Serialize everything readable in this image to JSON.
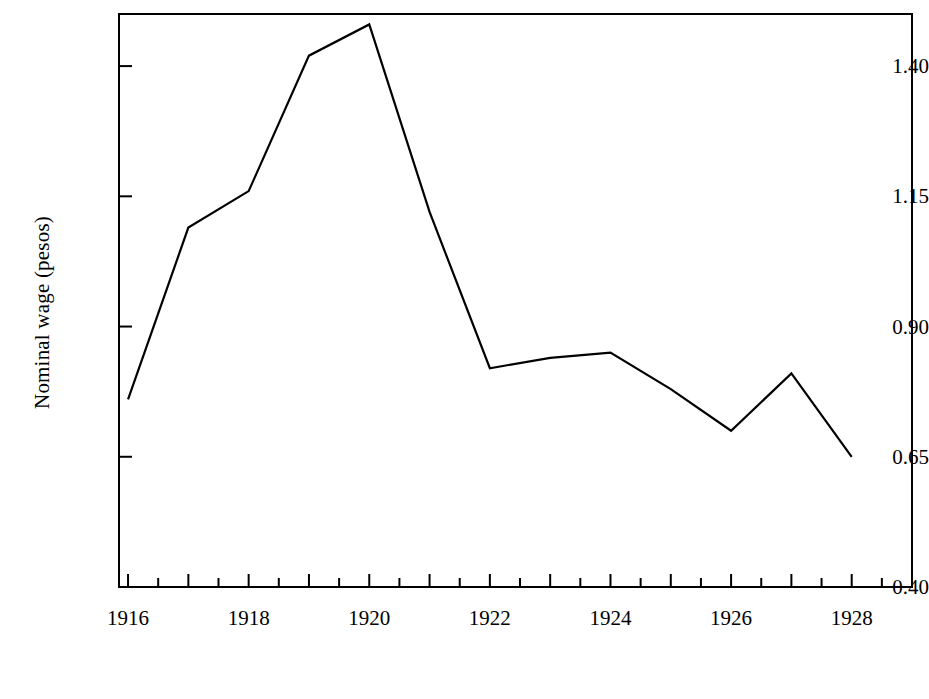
{
  "chart_data": {
    "type": "line",
    "title": "",
    "xlabel": "",
    "ylabel": "Nominal wage (pesos)",
    "x": [
      1916,
      1917,
      1918,
      1919,
      1920,
      1921,
      1922,
      1923,
      1924,
      1925,
      1926,
      1927,
      1928
    ],
    "values": [
      0.76,
      1.09,
      1.16,
      1.42,
      1.48,
      1.12,
      0.82,
      0.84,
      0.85,
      0.78,
      0.7,
      0.81,
      0.65
    ],
    "series": [
      {
        "name": "Nominal wage",
        "values": [
          0.76,
          1.09,
          1.16,
          1.42,
          1.48,
          1.12,
          0.82,
          0.84,
          0.85,
          0.78,
          0.7,
          0.81,
          0.65
        ]
      }
    ],
    "xlim": [
      1915.85,
      1929.0
    ],
    "ylim": [
      0.4,
      1.5
    ],
    "y_ticks": [
      0.4,
      0.65,
      0.9,
      1.15,
      1.4
    ],
    "y_tick_labels": [
      "0.40",
      "0.65",
      "0.90",
      "1.15",
      "1.40"
    ],
    "x_ticks": [
      1916,
      1917,
      1918,
      1919,
      1920,
      1921,
      1922,
      1923,
      1924,
      1925,
      1926,
      1927,
      1928
    ],
    "x_tick_labels": [
      "1916",
      "",
      "1918",
      "",
      "1920",
      "",
      "1922",
      "",
      "1924",
      "",
      "1926",
      "",
      "1928"
    ],
    "x_major_labels": [
      "1916",
      "1918",
      "1920",
      "1922",
      "1924",
      "1926",
      "1928"
    ],
    "x_major_positions": [
      1916,
      1918,
      1920,
      1922,
      1924,
      1926,
      1928
    ],
    "grid": false,
    "legend": null,
    "line_color": "#000000",
    "line_width": 2,
    "background_color": "#ffffff",
    "axis_color": "#000000",
    "markers": false
  }
}
